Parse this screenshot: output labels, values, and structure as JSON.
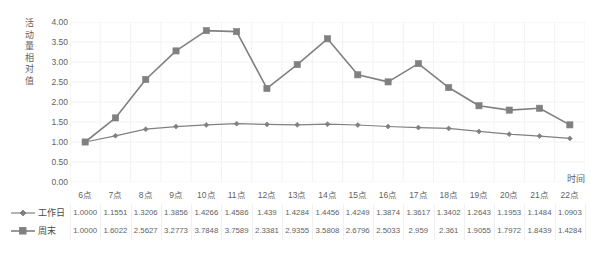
{
  "chart_data": {
    "type": "line",
    "title": "",
    "xlabel": "时间",
    "ylabel": "活动量相对值",
    "categories": [
      "6点",
      "7点",
      "8点",
      "9点",
      "10点",
      "11点",
      "12点",
      "13点",
      "14点",
      "15点",
      "16点",
      "17点",
      "18点",
      "19点",
      "20点",
      "21点",
      "22点"
    ],
    "series": [
      {
        "name": "工作日",
        "marker": "diamond",
        "color": "#808080",
        "values": [
          1.0,
          1.1551,
          1.3206,
          1.3856,
          1.4266,
          1.4586,
          1.439,
          1.4284,
          1.4456,
          1.4249,
          1.3874,
          1.3617,
          1.3402,
          1.2643,
          1.1953,
          1.1484,
          1.0903
        ],
        "labels": [
          "1.0000",
          "1.1551",
          "1.3206",
          "1.3856",
          "1.4266",
          "1.4586",
          "1.439",
          "1.4284",
          "1.4456",
          "1.4249",
          "1.3874",
          "1.3617",
          "1.3402",
          "1.2643",
          "1.1953",
          "1.1484",
          "1.0903"
        ]
      },
      {
        "name": "周末",
        "marker": "square",
        "color": "#808080",
        "values": [
          1.0,
          1.6022,
          2.5627,
          3.2773,
          3.7848,
          3.7589,
          2.3381,
          2.9355,
          3.5808,
          2.6796,
          2.5033,
          2.959,
          2.361,
          1.9055,
          1.7972,
          1.8439,
          1.4284
        ],
        "labels": [
          "1.0000",
          "1.6022",
          "2.5627",
          "3.2773",
          "3.7848",
          "3.7589",
          "2.3381",
          "2.9355",
          "3.5808",
          "2.6796",
          "2.5033",
          "2.959",
          "2.361",
          "1.9055",
          "1.7972",
          "1.8439",
          "1.4284"
        ]
      }
    ],
    "ylim": [
      0.0,
      4.0
    ],
    "yticks": [
      0.0,
      0.5,
      1.0,
      1.5,
      2.0,
      2.5,
      3.0,
      3.5,
      4.0
    ],
    "ytick_labels": [
      "0.00",
      "0.50",
      "1.00",
      "1.50",
      "2.00",
      "2.50",
      "3.00",
      "3.50",
      "4.00"
    ],
    "grid": true,
    "grid_color": "#f2f2f2",
    "legend_position": "bottom-table",
    "data_table_visible": true,
    "line_color": "#808080",
    "text_color": "#5f5f5f"
  }
}
